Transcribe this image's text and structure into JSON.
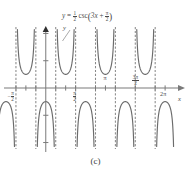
{
  "figure": {
    "caption": "(c)",
    "equation_plain": "y = 1/2 csc(3x + pi/2)",
    "equation_parts": {
      "y": "y",
      "equals": "=",
      "coef_num": "1",
      "coef_den": "2",
      "func": "csc",
      "open": "(",
      "arg_first": "3x",
      "plus": "+",
      "arg_num": "π",
      "arg_den": "2",
      "close": ")"
    },
    "axis_labels": {
      "x": "x",
      "y": "y"
    },
    "x_ticks": [
      {
        "label_num": "π",
        "label_den": "2",
        "sign": "−",
        "type": "frac",
        "value": -1.5708,
        "position": "below"
      },
      {
        "label_num": "π",
        "label_den": "2",
        "sign": "",
        "type": "frac",
        "value": 1.5708,
        "position": "below"
      },
      {
        "label": "π",
        "type": "plain",
        "value": 3.1416,
        "position": "above"
      },
      {
        "label_num": "3π",
        "label_den": "2",
        "sign": "",
        "type": "frac",
        "value": 4.7124,
        "position": "above"
      },
      {
        "label": "2π",
        "type": "plain",
        "value": 6.2832,
        "position": "below"
      }
    ],
    "colors": {
      "curve": "#6b6b6b",
      "asymptote": "#8a8a8a",
      "axis": "#7a7a7a",
      "text": "#4a4a4a",
      "background": "#ffffff"
    }
  },
  "chart_data": {
    "type": "line",
    "title": "",
    "subtitle": "",
    "xlabel": "x",
    "ylabel": "y",
    "function": "y = (1/2)*csc(3x + pi/2)",
    "amplitude": 0.5,
    "period": 2.0944,
    "phase_shift": -0.5236,
    "xlim": [
      -2.0944,
      7.3304
    ],
    "ylim": [
      -2.2,
      2.2
    ],
    "grid": false,
    "legend": null,
    "annotations": [
      {
        "text": "y = 1/2 csc(3x + pi/2)",
        "kind": "equation-callout",
        "leader_line": true
      }
    ],
    "asymptotes": [
      -1.5708,
      -0.5236,
      0.5236,
      1.5708,
      2.618,
      3.6652,
      4.7124,
      5.7596
    ],
    "branches": [
      {
        "orientation": "down",
        "center": -2.0944,
        "extremum": -0.5
      },
      {
        "orientation": "up",
        "center": -1.0472,
        "extremum": 0.5
      },
      {
        "orientation": "down",
        "center": 0.0,
        "extremum": -0.5
      },
      {
        "orientation": "up",
        "center": 1.0472,
        "extremum": 0.5
      },
      {
        "orientation": "down",
        "center": 2.0944,
        "extremum": -0.5
      },
      {
        "orientation": "up",
        "center": 3.1416,
        "extremum": 0.5
      },
      {
        "orientation": "down",
        "center": 4.1888,
        "extremum": -0.5
      },
      {
        "orientation": "up",
        "center": 5.236,
        "extremum": 0.5
      },
      {
        "orientation": "down",
        "center": 6.2832,
        "extremum": -0.5
      }
    ],
    "x_tick_values": [
      -1.5708,
      -1.0472,
      -0.5236,
      0.5236,
      1.0472,
      1.5708,
      2.618,
      3.1416,
      3.6652,
      4.7124,
      5.7596,
      6.2832
    ],
    "y_tick_values": [
      -2,
      -1,
      1,
      2
    ]
  }
}
